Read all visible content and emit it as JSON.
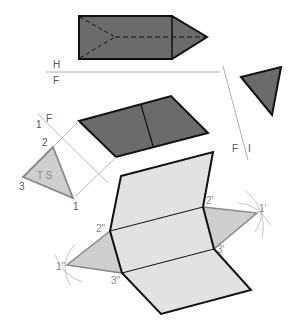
{
  "diagram": {
    "colors": {
      "dark_fill": "#6b6b6b",
      "light_fill": "#dcdcdc",
      "triangle_fill": "#bdbdbd",
      "outline": "#111111",
      "construction": "#999999"
    },
    "labels": {
      "H": "H",
      "F_top": "F",
      "one_F_left": "1",
      "F_left": "F",
      "F_right": "F",
      "one_right": "I",
      "v2": "2",
      "v3": "3",
      "v1": "1",
      "TS": "T S",
      "p2prime": "2'",
      "p1prime": "1'",
      "p3prime": "3'",
      "p2dprime": "2\"",
      "p1dprime": "1\"",
      "p3dprime": "3\""
    }
  }
}
